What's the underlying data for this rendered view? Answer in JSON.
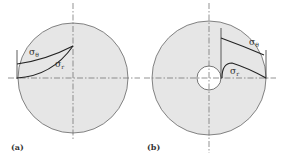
{
  "figure": {
    "panels": [
      {
        "id": "a",
        "label": "(a)",
        "description": "solid rotating disk",
        "curves": [
          {
            "name": "hoop-stress",
            "label": "σθ",
            "sub": "θ"
          },
          {
            "name": "radial-stress",
            "label": "σr",
            "sub": "r"
          }
        ]
      },
      {
        "id": "b",
        "label": "(b)",
        "description": "rotating disk with central hole",
        "curves": [
          {
            "name": "hoop-stress",
            "label": "σθ",
            "sub": "θ"
          },
          {
            "name": "radial-stress",
            "label": "σr",
            "sub": "r"
          }
        ]
      }
    ],
    "colors": {
      "disk_fill": "#e6e6e6",
      "outline": "#555555",
      "curve": "#222222",
      "centerline": "#666666"
    }
  }
}
